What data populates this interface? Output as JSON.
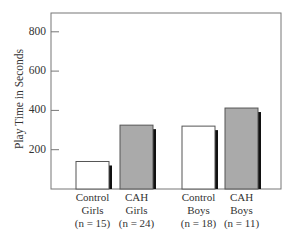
{
  "chart_data": {
    "type": "bar",
    "title": "",
    "xlabel": "",
    "ylabel": "Play Time in Seconds",
    "ylim": [
      0,
      900
    ],
    "yticks": [
      200,
      400,
      600,
      800
    ],
    "grid": false,
    "legend": null,
    "categories": [
      {
        "line1": "Control",
        "line2": "Girls",
        "line3": "(n = 15)"
      },
      {
        "line1": "CAH",
        "line2": "Girls",
        "line3": "(n = 24)"
      },
      {
        "line1": "Control",
        "line2": "Boys",
        "line3": "(n = 18)"
      },
      {
        "line1": "CAH",
        "line2": "Boys",
        "line3": "(n = 11)"
      }
    ],
    "values": [
      140,
      325,
      320,
      412
    ],
    "bar_colors": [
      "#ffffff",
      "#aaaaaa",
      "#ffffff",
      "#aaaaaa"
    ],
    "shadow_color": "#111111",
    "frame_color": "#777777"
  }
}
